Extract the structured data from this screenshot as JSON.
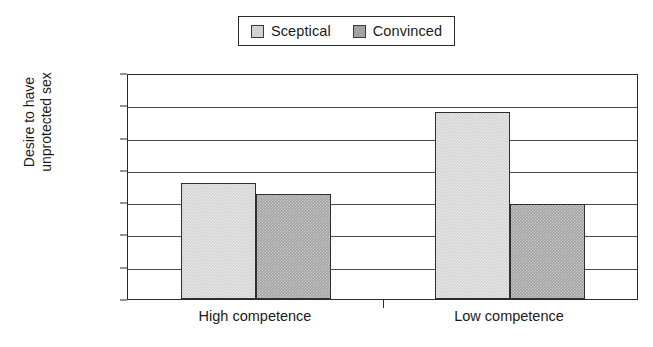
{
  "chart_data": {
    "type": "bar",
    "title": "",
    "xlabel": "",
    "ylabel": "Desire to have unprotected sex",
    "ylabel_line1": "Desire to have",
    "ylabel_line2": "unprotected sex",
    "categories": [
      "High competence",
      "Low competence"
    ],
    "series": [
      {
        "name": "Sceptical",
        "values": [
          1.8,
          2.9
        ],
        "color": "#d2d2d2"
      },
      {
        "name": "Convinced",
        "values": [
          1.62,
          1.47
        ],
        "color": "#a2a2a2"
      }
    ],
    "ylim": [
      0,
      3.5
    ],
    "ytick_labels": [
      "0",
      "0.5",
      "1",
      "1.5",
      "2",
      "2.5",
      "3",
      "3.5"
    ],
    "ytick_values": [
      0,
      0.5,
      1,
      1.5,
      2,
      2.5,
      3,
      3.5
    ],
    "grid": true,
    "legend_position": "top-center",
    "legend_entries": [
      "Sceptical",
      "Convinced"
    ]
  }
}
